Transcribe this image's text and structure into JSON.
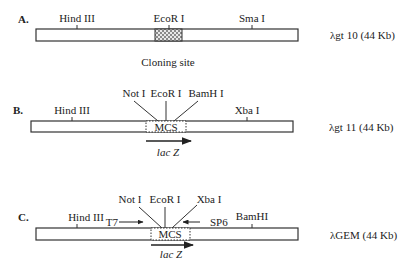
{
  "figure": {
    "panels": [
      {
        "id": "A",
        "label": "A.",
        "vector_name": "λgt 10 (44 Kb)",
        "sites": [
          "Hind III",
          "EcoR I",
          "Sma I"
        ],
        "insert_region_label": "Cloning site"
      },
      {
        "id": "B",
        "label": "B.",
        "vector_name": "λgt 11 (44 Kb)",
        "sites": [
          "Hind III",
          "Not I",
          "EcoR I",
          "BamH I",
          "Xba I"
        ],
        "insert_region_label": "MCS",
        "gene_label": "lac Z"
      },
      {
        "id": "C",
        "label": "C.",
        "vector_name": "λGEM (44 Kb)",
        "sites": [
          "Hind III",
          "Not I",
          "EcoR I",
          "Xba I",
          "BamHI"
        ],
        "insert_region_label": "MCS",
        "gene_label": "lac Z",
        "promoters": [
          "T7",
          "SP6"
        ]
      }
    ]
  }
}
